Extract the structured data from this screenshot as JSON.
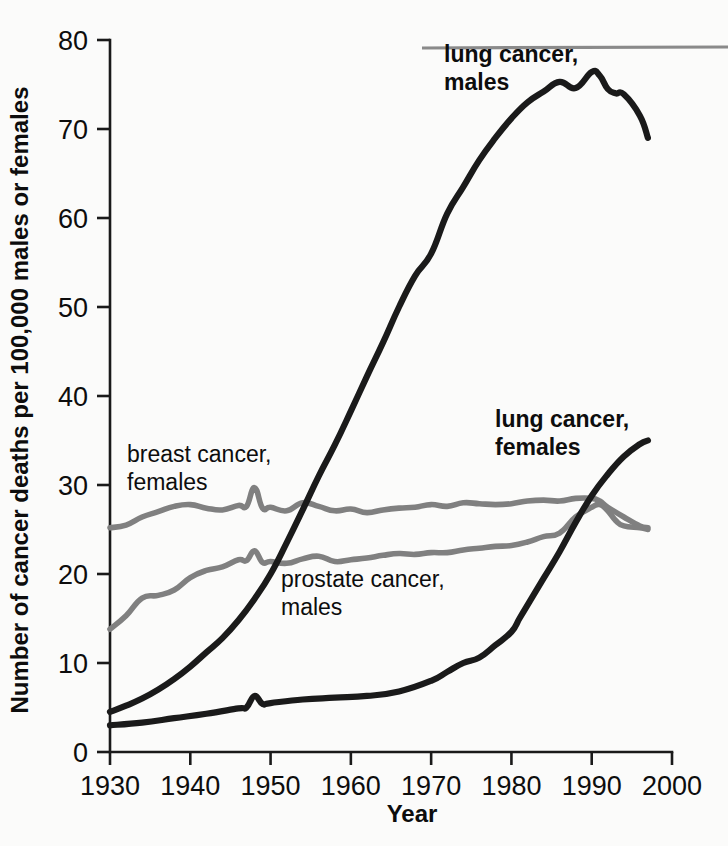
{
  "chart_data": {
    "type": "line",
    "title": "",
    "xlabel": "Year",
    "ylabel": "Number of cancer deaths per 100,000 males or females",
    "xlim": [
      1930,
      2000
    ],
    "ylim": [
      0,
      80
    ],
    "xticks": [
      1930,
      1940,
      1950,
      1960,
      1970,
      1980,
      1990,
      2000
    ],
    "yticks": [
      0,
      10,
      20,
      30,
      40,
      50,
      60,
      70,
      80
    ],
    "grid": false,
    "legend_position": "inline-annotations",
    "series": [
      {
        "name": "lung cancer, males",
        "color": "#1a1a1a",
        "label_bold": true,
        "x": [
          1930,
          1932,
          1934,
          1936,
          1938,
          1940,
          1942,
          1944,
          1946,
          1948,
          1950,
          1952,
          1954,
          1956,
          1958,
          1960,
          1962,
          1964,
          1966,
          1968,
          1970,
          1972,
          1974,
          1976,
          1978,
          1980,
          1982,
          1984,
          1986,
          1988,
          1990,
          1991,
          1992,
          1993,
          1994,
          1996,
          1997
        ],
        "values": [
          4.5,
          5.2,
          6.0,
          7.0,
          8.2,
          9.6,
          11.2,
          12.8,
          14.8,
          17.2,
          20.0,
          23.5,
          27.2,
          31.0,
          34.5,
          38.3,
          42.2,
          46.0,
          50.0,
          53.5,
          56.0,
          60.5,
          63.5,
          66.5,
          69.0,
          71.2,
          73.0,
          74.2,
          75.3,
          74.6,
          76.4,
          76.0,
          74.5,
          74.0,
          73.9,
          71.5,
          69.0
        ]
      },
      {
        "name": "lung cancer, females",
        "color": "#1a1a1a",
        "label_bold": true,
        "x": [
          1930,
          1934,
          1938,
          1942,
          1946,
          1947,
          1948,
          1949,
          1950,
          1954,
          1958,
          1962,
          1966,
          1970,
          1972,
          1974,
          1976,
          1978,
          1980,
          1981,
          1982,
          1984,
          1986,
          1988,
          1990,
          1992,
          1994,
          1996,
          1997
        ],
        "values": [
          3.0,
          3.3,
          3.8,
          4.3,
          4.9,
          5.0,
          6.3,
          5.4,
          5.5,
          5.9,
          6.1,
          6.3,
          6.8,
          8.0,
          9.0,
          10.0,
          10.6,
          12.0,
          13.5,
          15.0,
          16.5,
          19.5,
          22.5,
          25.8,
          28.8,
          31.2,
          33.2,
          34.6,
          35.0
        ]
      },
      {
        "name": "breast cancer, females",
        "color": "#808080",
        "label_bold": false,
        "x": [
          1930,
          1932,
          1934,
          1936,
          1938,
          1940,
          1942,
          1944,
          1946,
          1947,
          1948,
          1949,
          1950,
          1952,
          1954,
          1956,
          1958,
          1960,
          1962,
          1964,
          1966,
          1968,
          1970,
          1972,
          1974,
          1976,
          1978,
          1980,
          1982,
          1984,
          1986,
          1988,
          1990,
          1991,
          1992,
          1994,
          1996,
          1997
        ],
        "values": [
          25.2,
          25.5,
          26.4,
          27.0,
          27.6,
          27.8,
          27.4,
          27.2,
          27.7,
          27.6,
          29.7,
          27.4,
          27.5,
          27.1,
          28.0,
          27.6,
          27.1,
          27.3,
          26.9,
          27.2,
          27.4,
          27.5,
          27.8,
          27.6,
          28.0,
          27.9,
          27.8,
          27.9,
          28.2,
          28.3,
          28.2,
          28.5,
          28.5,
          28.2,
          27.5,
          26.4,
          25.4,
          25.2
        ]
      },
      {
        "name": "prostate cancer, males",
        "color": "#808080",
        "label_bold": false,
        "x": [
          1930,
          1932,
          1934,
          1936,
          1938,
          1940,
          1942,
          1944,
          1946,
          1947,
          1948,
          1949,
          1950,
          1952,
          1954,
          1956,
          1958,
          1960,
          1962,
          1964,
          1966,
          1968,
          1970,
          1972,
          1974,
          1976,
          1978,
          1980,
          1982,
          1984,
          1986,
          1988,
          1990,
          1991,
          1992,
          1993,
          1994,
          1996,
          1997
        ],
        "values": [
          13.8,
          15.3,
          17.3,
          17.6,
          18.2,
          19.6,
          20.4,
          20.8,
          21.6,
          21.5,
          22.6,
          21.3,
          21.4,
          21.2,
          21.7,
          22.0,
          21.4,
          21.6,
          21.8,
          22.1,
          22.3,
          22.2,
          22.4,
          22.4,
          22.7,
          22.9,
          23.1,
          23.2,
          23.6,
          24.2,
          24.6,
          26.4,
          27.5,
          27.8,
          27.1,
          26.0,
          25.4,
          25.2,
          25.0
        ]
      }
    ],
    "annotations": [
      {
        "text_lines": [
          "lung cancer,",
          "males"
        ],
        "x_px": 444,
        "y_px": 62,
        "bold": true
      },
      {
        "text_lines": [
          "lung cancer,",
          "females"
        ],
        "x_px": 495,
        "y_px": 427,
        "bold": true
      },
      {
        "text_lines": [
          "breast cancer,",
          "females"
        ],
        "x_px": 127,
        "y_px": 462,
        "bold": false
      },
      {
        "text_lines": [
          "prostate cancer,",
          "males"
        ],
        "x_px": 281,
        "y_px": 587,
        "bold": false
      }
    ],
    "artifacts": [
      {
        "name": "scan-line",
        "x1_px": 422,
        "y1_px": 48,
        "x2_px": 728,
        "y2_px": 47,
        "color": "#8a8a8a"
      }
    ]
  }
}
